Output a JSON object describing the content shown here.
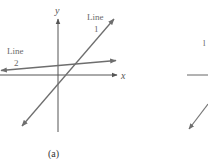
{
  "figure": {
    "panel_a": {
      "caption": "(a)",
      "x_axis_label": "x",
      "y_axis_label": "y",
      "line1": {
        "label_word": "Line",
        "label_num": "1"
      },
      "line2": {
        "label_word": "Line",
        "label_num": "2"
      }
    },
    "panel_b_partial": {
      "label_fragment": "l"
    }
  },
  "colors": {
    "line": "#6e6e6e",
    "axis": "#555555"
  }
}
